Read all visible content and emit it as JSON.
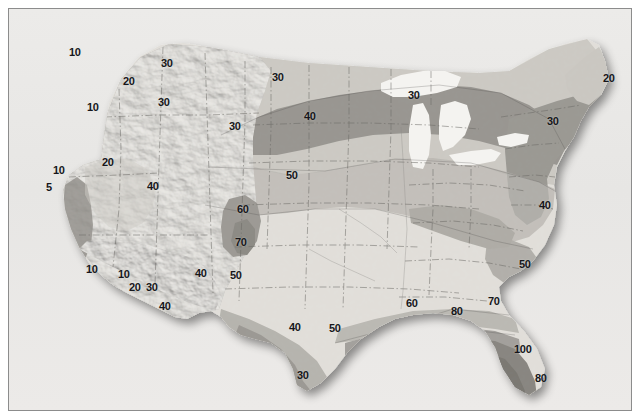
{
  "figure": {
    "kind": "contour-map",
    "region": "Continental United States",
    "background_color": "#e9e9e7",
    "frame_color": "#8c8c8c"
  },
  "chart_data": {
    "type": "heatmap",
    "title": "",
    "subtitle": "",
    "xlabel": "",
    "ylabel": "",
    "grid": false,
    "legend": "none",
    "projection": "Continental United States, shaded relief base",
    "contour_interval": 10,
    "value_range": [
      5,
      100
    ],
    "contour_levels": [
      5,
      10,
      20,
      30,
      40,
      50,
      60,
      70,
      80,
      100
    ],
    "shade_bands": [
      {
        "level": "lightest",
        "color": "#e3e1dc",
        "approx_values": "40-50 interior plains"
      },
      {
        "level": "light",
        "color": "#c9c7c1",
        "approx_values": "30-40"
      },
      {
        "level": "mid",
        "color": "#a8a6a0",
        "approx_values": "50-60"
      },
      {
        "level": "dark",
        "color": "#8c8a85",
        "approx_values": "60-80"
      },
      {
        "level": "darkest",
        "color": "#6e6c68",
        "approx_values": "80-100"
      },
      {
        "level": "lakes",
        "color": "#f3f2ef",
        "approx_values": "Great Lakes water"
      }
    ],
    "labels": [
      {
        "text": "10",
        "x": 68,
        "y": 46,
        "region": "Washington / Puget Sound"
      },
      {
        "text": "30",
        "x": 160,
        "y": 57,
        "region": "northern Idaho / Montana border"
      },
      {
        "text": "20",
        "x": 122,
        "y": 75,
        "region": "eastern Washington"
      },
      {
        "text": "10",
        "x": 86,
        "y": 101,
        "region": "Oregon"
      },
      {
        "text": "30",
        "x": 157,
        "y": 96,
        "region": "Idaho"
      },
      {
        "text": "30",
        "x": 271,
        "y": 71,
        "region": "North Dakota"
      },
      {
        "text": "20",
        "x": 602,
        "y": 72,
        "region": "northern New England / Maine"
      },
      {
        "text": "40",
        "x": 303,
        "y": 110,
        "region": "South Dakota"
      },
      {
        "text": "30",
        "x": 407,
        "y": 89,
        "region": "Upper Michigan / Lake Superior"
      },
      {
        "text": "30",
        "x": 228,
        "y": 120,
        "region": "Wyoming / Montana"
      },
      {
        "text": "30",
        "x": 546,
        "y": 115,
        "region": "New York / Pennsylvania"
      },
      {
        "text": "10",
        "x": 52,
        "y": 164,
        "region": "northern California coast"
      },
      {
        "text": "20",
        "x": 101,
        "y": 156,
        "region": "Nevada"
      },
      {
        "text": "40",
        "x": 146,
        "y": 180,
        "region": "Utah"
      },
      {
        "text": "50",
        "x": 285,
        "y": 169,
        "region": "Nebraska / Kansas"
      },
      {
        "text": "5",
        "x": 45,
        "y": 181,
        "region": "central California coast"
      },
      {
        "text": "60",
        "x": 236,
        "y": 203,
        "region": "Colorado front range"
      },
      {
        "text": "40",
        "x": 538,
        "y": 199,
        "region": "Virginia"
      },
      {
        "text": "70",
        "x": 234,
        "y": 236,
        "region": "New Mexico / Colorado"
      },
      {
        "text": "50",
        "x": 518,
        "y": 258,
        "region": "South Carolina"
      },
      {
        "text": "10",
        "x": 85,
        "y": 263,
        "region": "southern California"
      },
      {
        "text": "10",
        "x": 117,
        "y": 268,
        "region": "southern California / Arizona"
      },
      {
        "text": "40",
        "x": 194,
        "y": 267,
        "region": "New Mexico"
      },
      {
        "text": "50",
        "x": 229,
        "y": 269,
        "region": "Texas panhandle"
      },
      {
        "text": "20",
        "x": 128,
        "y": 281,
        "region": "Arizona"
      },
      {
        "text": "30",
        "x": 145,
        "y": 281,
        "region": "Arizona"
      },
      {
        "text": "40",
        "x": 158,
        "y": 300,
        "region": "southern Arizona"
      },
      {
        "text": "60",
        "x": 405,
        "y": 297,
        "region": "Mississippi / Alabama"
      },
      {
        "text": "70",
        "x": 487,
        "y": 295,
        "region": "Georgia / Florida line"
      },
      {
        "text": "80",
        "x": 450,
        "y": 305,
        "region": "Gulf coast"
      },
      {
        "text": "40",
        "x": 288,
        "y": 321,
        "region": "west Texas"
      },
      {
        "text": "50",
        "x": 328,
        "y": 322,
        "region": "central Texas"
      },
      {
        "text": "100",
        "x": 513,
        "y": 343,
        "region": "central Florida"
      },
      {
        "text": "30",
        "x": 296,
        "y": 369,
        "region": "south Texas"
      },
      {
        "text": "80",
        "x": 534,
        "y": 372,
        "region": "south Florida"
      }
    ]
  }
}
